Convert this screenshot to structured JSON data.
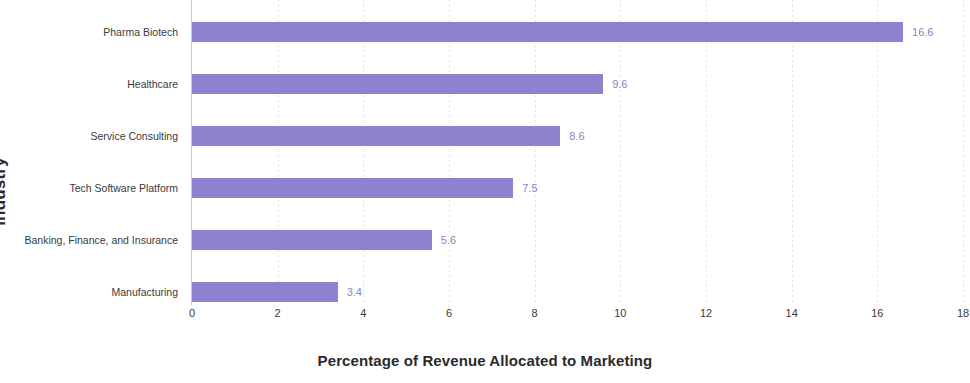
{
  "chart_data": {
    "type": "bar",
    "orientation": "horizontal",
    "title": "",
    "xlabel": "Percentage of Revenue Allocated to Marketing",
    "ylabel": "Industry",
    "categories": [
      "Pharma Biotech",
      "Healthcare",
      "Service Consulting",
      "Tech Software Platform",
      "Banking, Finance, and Insurance",
      "Manufacturing"
    ],
    "values": [
      16.6,
      9.6,
      8.6,
      7.5,
      5.6,
      3.4
    ],
    "value_labels": [
      "16.6",
      "9.6",
      "8.6",
      "7.5",
      "5.6",
      "3.4"
    ],
    "xlim": [
      0,
      18
    ],
    "xticks": [
      0,
      2,
      4,
      6,
      8,
      10,
      12,
      14,
      16,
      18
    ],
    "xtick_labels": [
      "0",
      "2",
      "4",
      "6",
      "8",
      "10",
      "12",
      "14",
      "16",
      "18"
    ],
    "grid": true,
    "grid_axis": "x",
    "legend": false,
    "bar_color": "#8e82cf",
    "label_color": "#8b81c4",
    "grid_color": "#e2e2e6",
    "axis_color": "#c9c9cf",
    "text_color": "#3a3a3a"
  }
}
